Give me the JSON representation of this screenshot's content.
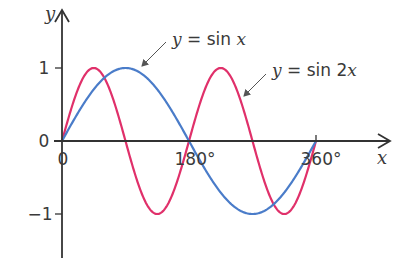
{
  "chart_data": {
    "type": "line",
    "title": "",
    "xlabel": "x",
    "ylabel": "y",
    "xlim": [
      0,
      360
    ],
    "ylim": [
      -1,
      1
    ],
    "grid": false,
    "x_ticks": [
      {
        "value": 0,
        "label": "0"
      },
      {
        "value": 180,
        "label": "180°"
      },
      {
        "value": 360,
        "label": "360°"
      }
    ],
    "y_ticks": [
      {
        "value": 1,
        "label": "1"
      },
      {
        "value": 0,
        "label": "0"
      },
      {
        "value": -1,
        "label": "−1"
      }
    ],
    "series": [
      {
        "name": "y = sin x",
        "function": "sin(x)",
        "color": "#4a7cc9",
        "x": [
          0,
          45,
          90,
          135,
          180,
          225,
          270,
          315,
          360
        ],
        "values": [
          0,
          0.707,
          1,
          0.707,
          0,
          -0.707,
          -1,
          -0.707,
          0
        ]
      },
      {
        "name": "y = sin 2x",
        "function": "sin(2x)",
        "color": "#e0306a",
        "x": [
          0,
          45,
          90,
          135,
          180,
          225,
          270,
          315,
          360
        ],
        "values": [
          0,
          1,
          0,
          -1,
          0,
          1,
          0,
          -1,
          0
        ]
      }
    ],
    "annotations": [
      {
        "series": "y = sin x",
        "prefix_var": "y",
        "text": " = sin ",
        "suffix_var": "x",
        "points_to_x": 90
      },
      {
        "series": "y = sin 2x",
        "prefix_var": "y",
        "text": " = sin 2",
        "suffix_var": "x",
        "points_to_x": 214
      }
    ]
  }
}
